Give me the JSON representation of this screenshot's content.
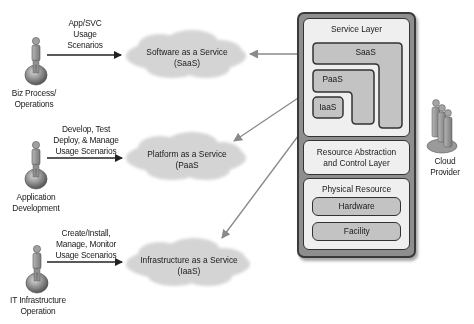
{
  "actors": [
    {
      "label_lines": [
        "Biz Process/",
        "Operations"
      ],
      "usage_lines": [
        "App/SVC",
        "Usage",
        "Scenarios"
      ]
    },
    {
      "label_lines": [
        "Application",
        "Development"
      ],
      "usage_lines": [
        "Develop, Test",
        "Deploy, & Manage",
        "Usage Scenarios"
      ]
    },
    {
      "label_lines": [
        "IT Infrastructure",
        "Operation"
      ],
      "usage_lines": [
        "Create/Install,",
        "Manage, Monitor",
        "Usage Scenarios"
      ]
    }
  ],
  "clouds": [
    {
      "line1": "Software as a Service",
      "line2": "(SaaS)"
    },
    {
      "line1": "Platform as a Service",
      "line2": "(PaaS"
    },
    {
      "line1": "Infrastructure as a Service",
      "line2": "(IaaS)"
    }
  ],
  "stack": {
    "service_layer": {
      "title": "Service Layer",
      "saas": "SaaS",
      "paas": "PaaS",
      "iaas": "IaaS"
    },
    "resource_abstraction": {
      "line1": "Resource Abstraction",
      "line2": "and Control Layer"
    },
    "physical_layer": {
      "title": "Physical Resource Layer",
      "hardware": "Hardware",
      "facility": "Facility"
    }
  },
  "provider": {
    "line1": "Cloud",
    "line2": "Provider"
  },
  "colors": {
    "cloud_fill": "#d4d4d4",
    "outer_fill": "#8e8e8e",
    "panel_fill": "#efefef",
    "pill_fill": "#c3c3c3",
    "arrow_dark": "#222222",
    "arrow_gray": "#8a8a8a"
  }
}
